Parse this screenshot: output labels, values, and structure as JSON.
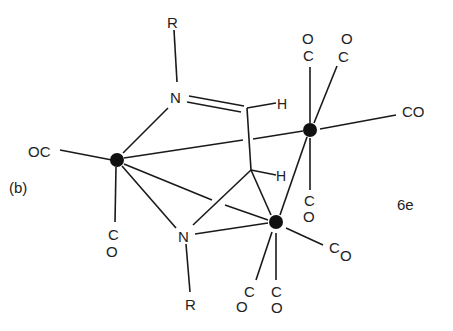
{
  "diagram": {
    "panel_label": "(b)",
    "compound_label": "6e",
    "labels": {
      "r_top": "R",
      "r_bottom": "R",
      "n_top": "N",
      "n_bottom": "N",
      "h_top": "H",
      "h_mid": "H",
      "oc_left": "OC",
      "co_fe1_down_c": "C",
      "co_fe1_down_o": "O",
      "co_fe2_up1_o": "O",
      "co_fe2_up1_c": "C",
      "co_fe2_up2_o": "O",
      "co_fe2_up2_c": "C",
      "co_fe2_right": "CO",
      "co_fe2_down_c": "C",
      "co_fe2_down_o": "O",
      "co_fe3_right_c": "C",
      "co_fe3_right_o": "O",
      "co_fe3_down1_c": "C",
      "co_fe3_down1_o": "O",
      "co_fe3_down2_c": "C",
      "co_fe3_down2_o": "O"
    },
    "colors": {
      "ink": "#1a1a1a",
      "background": "#ffffff"
    }
  }
}
